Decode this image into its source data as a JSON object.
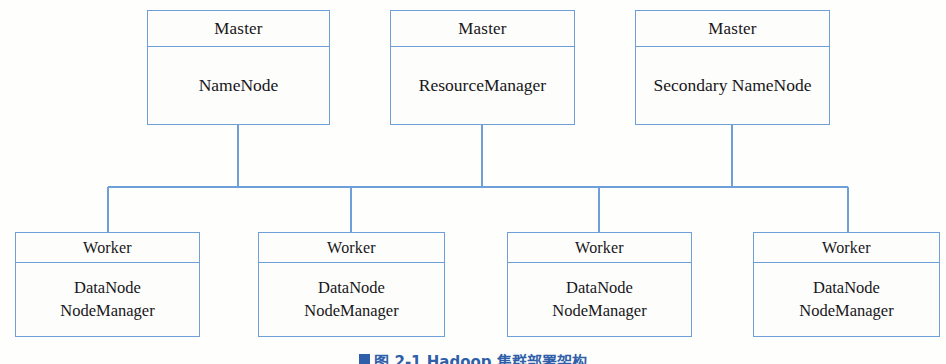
{
  "figure": {
    "caption_marker": "figure-square-marker",
    "caption_text": "图 2-1  Hadoop 集群部署架构",
    "caption_clipped": true
  },
  "style": {
    "line_color": "#6f9fd8",
    "box_fill": "#fdfdfb",
    "text_color": "#17161a",
    "caption_color": "#2f5fa8",
    "page_background": "#fefefd"
  },
  "masters": [
    {
      "header": "Master",
      "body_line1": "NameNode",
      "body_line2": "",
      "x": 147,
      "y": 10,
      "w": 183,
      "h": 115
    },
    {
      "header": "Master",
      "body_line1": "ResourceManager",
      "body_line2": "",
      "x": 390,
      "y": 10,
      "w": 185,
      "h": 115
    },
    {
      "header": "Master",
      "body_line1": "Secondary NameNode",
      "body_line2": "",
      "x": 635,
      "y": 10,
      "w": 195,
      "h": 115
    }
  ],
  "workers": [
    {
      "header": "Worker",
      "body_line1": "DataNode",
      "body_line2": "NodeManager",
      "x": 15,
      "y": 232,
      "w": 185,
      "h": 105
    },
    {
      "header": "Worker",
      "body_line1": "DataNode",
      "body_line2": "NodeManager",
      "x": 258,
      "y": 232,
      "w": 187,
      "h": 105
    },
    {
      "header": "Worker",
      "body_line1": "DataNode",
      "body_line2": "NodeManager",
      "x": 507,
      "y": 232,
      "w": 185,
      "h": 105
    },
    {
      "header": "Worker",
      "body_line1": "DataNode",
      "body_line2": "NodeManager",
      "x": 753,
      "y": 232,
      "w": 187,
      "h": 105
    }
  ],
  "connectors": {
    "bus_y": 187,
    "bus_x_start": 108,
    "bus_x_end": 848,
    "master_drops_x": [
      238,
      482,
      732
    ],
    "master_bottom_y": 125,
    "worker_drops_x": [
      108,
      351,
      599,
      848
    ],
    "worker_top_y": 232
  }
}
